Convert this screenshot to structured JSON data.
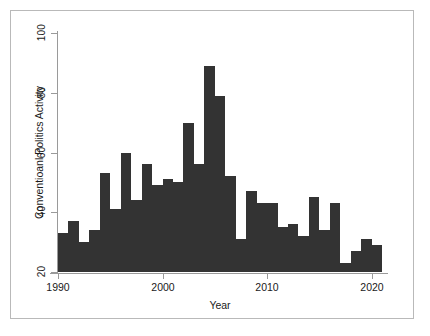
{
  "chart_data": {
    "type": "bar",
    "title": "",
    "xlabel": "Year",
    "ylabel": "Conventioanl Politics Activity",
    "xlim": [
      1990,
      2021
    ],
    "ylim": [
      20,
      100
    ],
    "grid": false,
    "legend": null,
    "bar_color": "#333333",
    "axis_color": "#9a9a9a",
    "frame_color": "#b9b9b9",
    "background": "#ffffff",
    "xticks": [
      "1990",
      "2000",
      "2010",
      "2020"
    ],
    "xtick_values": [
      1990,
      2000,
      2010,
      2020
    ],
    "yticks": [
      "20",
      "40",
      "60",
      "80",
      "100"
    ],
    "ytick_values": [
      20,
      40,
      60,
      80,
      100
    ],
    "categories": [
      "1990",
      "1991",
      "1992",
      "1993",
      "1994",
      "1995",
      "1996",
      "1997",
      "1998",
      "1999",
      "2000",
      "2001",
      "2002",
      "2003",
      "2004",
      "2005",
      "2006",
      "2007",
      "2008",
      "2009",
      "2010",
      "2011",
      "2012",
      "2013",
      "2014",
      "2015",
      "2016",
      "2017",
      "2018",
      "2019",
      "2020"
    ],
    "values": [
      33,
      37,
      30,
      34,
      53,
      41,
      60,
      44,
      56,
      49,
      51,
      50,
      70,
      56,
      89,
      79,
      52,
      31,
      47,
      43,
      43,
      35,
      36,
      32,
      45,
      34,
      43,
      23,
      27,
      31,
      29
    ]
  }
}
